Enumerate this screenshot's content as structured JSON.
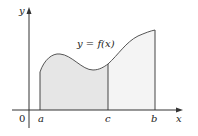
{
  "diagram": {
    "type": "area-under-curve",
    "curve_label": "y = f(x)",
    "axes": {
      "x_label": "x",
      "y_label": "y",
      "origin_label": "0"
    },
    "ticks": [
      {
        "name": "a",
        "label": "a"
      },
      {
        "name": "c",
        "label": "c"
      },
      {
        "name": "b",
        "label": "b"
      }
    ],
    "regions": [
      {
        "name": "a-to-c",
        "fill": "#e6e6e6"
      },
      {
        "name": "c-to-b",
        "fill": "#f4f4f4"
      }
    ],
    "colors": {
      "axis": "#333333",
      "curve": "#555555",
      "text": "#222222"
    }
  }
}
